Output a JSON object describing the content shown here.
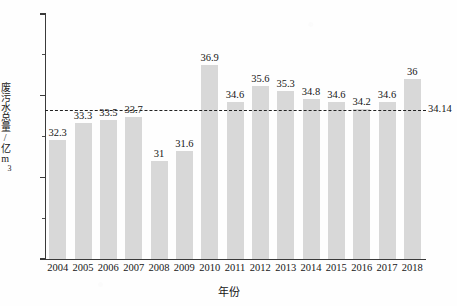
{
  "chart_data": {
    "type": "bar",
    "title": "",
    "xlabel": "年份",
    "ylabel": "废污水总量/亿m³",
    "ylabel_main": "废污水总量/亿m",
    "ylabel_sup": "3",
    "categories": [
      "2004",
      "2005",
      "2006",
      "2007",
      "2008",
      "2009",
      "2010",
      "2011",
      "2012",
      "2013",
      "2014",
      "2015",
      "2016",
      "2017",
      "2018"
    ],
    "values": [
      32.3,
      33.3,
      33.5,
      33.7,
      31,
      31.6,
      36.9,
      34.6,
      35.6,
      35.3,
      34.8,
      34.6,
      34.2,
      34.6,
      36
    ],
    "value_labels": [
      "32.3",
      "33.3",
      "33.5",
      "33.7",
      "31",
      "31.6",
      "36.9",
      "34.6",
      "35.6",
      "35.3",
      "34.8",
      "34.6",
      "34.2",
      "34.6",
      "36"
    ],
    "ylim": [
      25,
      40
    ],
    "y_major_ticks": [
      25,
      30,
      35,
      40
    ],
    "y_major_tick_labels": [
      "25",
      "30",
      "35",
      "40"
    ],
    "y_minor_ticks": [
      27.5,
      32.5,
      37.5
    ],
    "grid": false,
    "legend": "none",
    "bar_color": "#d8d8d8",
    "axis_color": "#3a3a3a",
    "reference_line": {
      "value": 34.14,
      "label": "34.14",
      "style": "dashed",
      "color": "#222222"
    }
  }
}
